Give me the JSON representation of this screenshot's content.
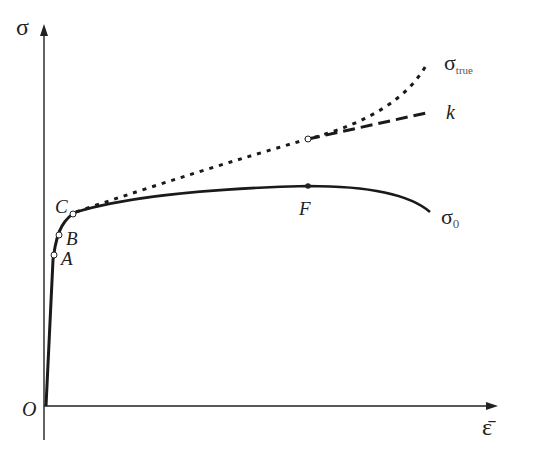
{
  "diagram": {
    "axes": {
      "y_label": "σ",
      "x_label": "ε̄",
      "origin_label": "O"
    },
    "points": {
      "A": "A",
      "B": "B",
      "C": "C",
      "F": "F"
    },
    "curves": {
      "true_stress_label": "σ",
      "true_stress_sub": "true",
      "k_label": "k",
      "nominal_label": "σ",
      "nominal_sub": "0"
    },
    "colors": {
      "line": "#1a1a1a",
      "text": "#222222"
    }
  }
}
